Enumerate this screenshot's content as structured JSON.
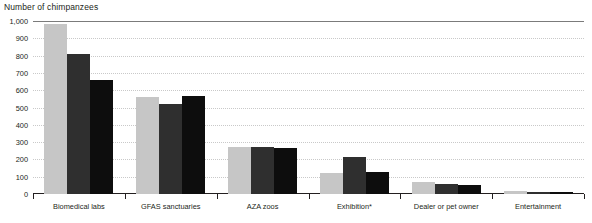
{
  "chart_data": {
    "type": "bar",
    "title": "Number of chimpanzees",
    "xlabel": "",
    "ylabel": "",
    "ylim": [
      0,
      1000
    ],
    "ytick_labels": [
      "1,000",
      "900",
      "800",
      "700",
      "600",
      "500",
      "400",
      "300",
      "200",
      "100",
      "0"
    ],
    "ytick_values": [
      1000,
      900,
      800,
      700,
      600,
      500,
      400,
      300,
      200,
      100,
      0
    ],
    "grid": true,
    "legend": "none",
    "categories": [
      "Biomedical labs",
      "GFAS sanctuaries",
      "AZA zoos",
      "Exhibition*",
      "Dealer or pet owner",
      "Entertainment"
    ],
    "series": [
      {
        "name": "series-1",
        "color": "#c6c6c6",
        "values": [
          980,
          560,
          270,
          120,
          70,
          18
        ]
      },
      {
        "name": "series-2",
        "color": "#2f2f2f",
        "values": [
          810,
          520,
          270,
          215,
          60,
          14
        ]
      },
      {
        "name": "series-3",
        "color": "#0d0d0d",
        "values": [
          660,
          565,
          268,
          125,
          55,
          12
        ]
      }
    ],
    "footnote": ""
  }
}
